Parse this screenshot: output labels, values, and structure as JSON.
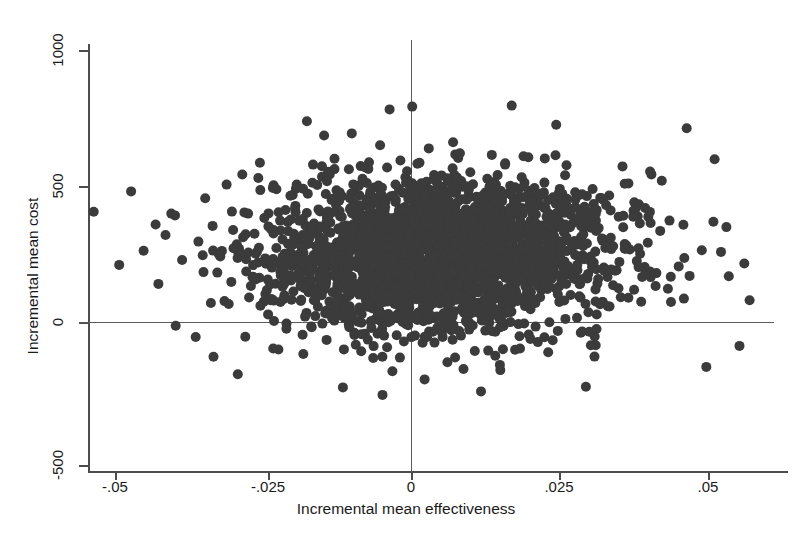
{
  "chart_data": {
    "type": "scatter",
    "title": "",
    "xlabel": "Incremental mean effectiveness",
    "ylabel": "Incremental mean cost",
    "xlim": [
      -0.0575,
      0.0625
    ],
    "ylim": [
      -560,
      1055
    ],
    "xticks": [
      -0.05,
      -0.025,
      0,
      0.025,
      0.05
    ],
    "xticklabels": [
      "-.05",
      "-.025",
      "0",
      ".025",
      ".05"
    ],
    "yticks": [
      -500,
      0,
      500,
      1000
    ],
    "yticklabels": [
      "-500",
      "0",
      "500",
      "1000"
    ],
    "grid": false,
    "legend": null,
    "marker": {
      "shape": "circle",
      "size_px": 10,
      "color": "#3b3b3b",
      "opacity": 1
    },
    "reference_lines": [
      {
        "axis": "y",
        "value": 0,
        "label": "zero incremental cost"
      },
      {
        "axis": "x",
        "value": 0,
        "label": "zero incremental effectiveness"
      }
    ],
    "n_points": 2600,
    "cloud": {
      "center_x": 0.0045,
      "center_y": 248,
      "sd_x": 0.0143,
      "sd_y": 142,
      "correlation": 0.04
    },
    "outliers": [
      {
        "x": -0.0535,
        "y": 405
      },
      {
        "x": -0.0472,
        "y": 480
      },
      {
        "x": -0.0492,
        "y": 210
      },
      {
        "x": -0.0451,
        "y": 262
      },
      {
        "x": -0.0426,
        "y": 140
      },
      {
        "x": -0.0414,
        "y": 320
      },
      {
        "x": -0.0398,
        "y": 392
      },
      {
        "x": -0.0386,
        "y": 228
      },
      {
        "x": -0.0363,
        "y": -55
      },
      {
        "x": -0.0347,
        "y": 455
      },
      {
        "x": -0.0333,
        "y": -128
      },
      {
        "x": -0.0311,
        "y": 505
      },
      {
        "x": -0.0292,
        "y": -192
      },
      {
        "x": 0.0512,
        "y": 598
      },
      {
        "x": 0.0536,
        "y": 168
      },
      {
        "x": 0.0562,
        "y": 215
      },
      {
        "x": 0.0571,
        "y": 80
      },
      {
        "x": 0.0554,
        "y": -88
      },
      {
        "x": 0.0498,
        "y": -165
      },
      {
        "x": 0.0465,
        "y": 712
      },
      {
        "x": 0.0002,
        "y": 792
      },
      {
        "x": -0.0048,
        "y": -268
      },
      {
        "x": 0.0118,
        "y": -255
      },
      {
        "x": 0.0295,
        "y": -238
      }
    ]
  },
  "axis": {
    "x_title": "Incremental mean effectiveness",
    "y_title": "Incremental mean cost",
    "x_tick_labels": [
      "-.05",
      "-.025",
      "0",
      ".025",
      ".05"
    ],
    "y_tick_labels": [
      "1000",
      "500",
      "0",
      "-500"
    ]
  },
  "colors": {
    "marker": "#3b3b3b",
    "axis": "#4c4c4c",
    "reference_line": "#5a5a5a",
    "background": "#ffffff",
    "text": "#1a1a1a"
  }
}
